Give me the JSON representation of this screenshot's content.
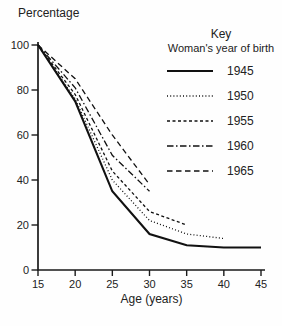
{
  "page": {
    "background": "#fefefe",
    "ink_color": "#1a1a1a"
  },
  "chart_data": {
    "type": "line",
    "title": "",
    "ylabel": "Percentage",
    "xlabel": "Age (years)",
    "xlim": [
      15,
      45
    ],
    "ylim": [
      0,
      100
    ],
    "x_ticks": [
      15,
      20,
      25,
      30,
      35,
      40,
      45
    ],
    "y_ticks": [
      0,
      20,
      40,
      60,
      80,
      100
    ],
    "grid": false,
    "legend": {
      "title": "Key",
      "subtitle": "Woman's year of birth",
      "position": "top-right"
    },
    "series": [
      {
        "name": "1945",
        "dash": "solid",
        "x": [
          15,
          20,
          25,
          30,
          35,
          40,
          45
        ],
        "values": [
          100,
          75,
          35,
          16,
          11,
          10,
          10
        ]
      },
      {
        "name": "1950",
        "dash": "fine-dot",
        "x": [
          15,
          20,
          25,
          30,
          35,
          40
        ],
        "values": [
          100,
          76,
          40,
          22,
          16,
          14
        ]
      },
      {
        "name": "1955",
        "dash": "short-dash",
        "x": [
          15,
          20,
          25,
          30,
          35
        ],
        "values": [
          100,
          78,
          44,
          26,
          20
        ]
      },
      {
        "name": "1960",
        "dash": "dash-dot",
        "x": [
          15,
          20,
          25,
          30
        ],
        "values": [
          100,
          81,
          51,
          35
        ]
      },
      {
        "name": "1965",
        "dash": "medium-dash",
        "x": [
          15,
          20,
          25,
          30
        ],
        "values": [
          100,
          85,
          60,
          38
        ]
      }
    ]
  }
}
